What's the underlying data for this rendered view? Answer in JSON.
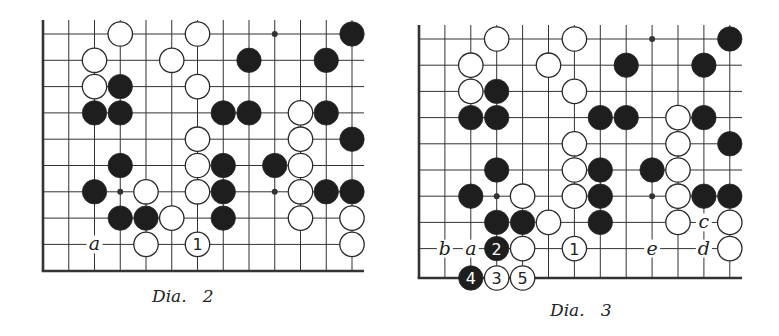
{
  "diagrams": [
    {
      "id": "dia2",
      "caption": "Dia.   2",
      "caption_pos": [
        152,
        286
      ],
      "origin": [
        43,
        34
      ],
      "spacing": [
        25.75,
        26.3
      ],
      "top_line_y": 20,
      "right_line_x": 364,
      "bottom_edge_row": 9,
      "bottom_edge_y": 271,
      "cols": 13,
      "stars": [
        [
          9,
          0
        ],
        [
          3,
          6
        ],
        [
          9,
          6
        ]
      ],
      "stones": [
        {
          "c": 3,
          "r": 0,
          "color": "white"
        },
        {
          "c": 6,
          "r": 0,
          "color": "white"
        },
        {
          "c": 12,
          "r": 0,
          "color": "black"
        },
        {
          "c": 2,
          "r": 1,
          "color": "white"
        },
        {
          "c": 5,
          "r": 1,
          "color": "white"
        },
        {
          "c": 8,
          "r": 1,
          "color": "black"
        },
        {
          "c": 11,
          "r": 1,
          "color": "black"
        },
        {
          "c": 2,
          "r": 2,
          "color": "white"
        },
        {
          "c": 3,
          "r": 2,
          "color": "black"
        },
        {
          "c": 6,
          "r": 2,
          "color": "white"
        },
        {
          "c": 2,
          "r": 3,
          "color": "black"
        },
        {
          "c": 3,
          "r": 3,
          "color": "black"
        },
        {
          "c": 7,
          "r": 3,
          "color": "black"
        },
        {
          "c": 8,
          "r": 3,
          "color": "black"
        },
        {
          "c": 10,
          "r": 3,
          "color": "white"
        },
        {
          "c": 11,
          "r": 3,
          "color": "black"
        },
        {
          "c": 6,
          "r": 4,
          "color": "white"
        },
        {
          "c": 10,
          "r": 4,
          "color": "white"
        },
        {
          "c": 12,
          "r": 4,
          "color": "black"
        },
        {
          "c": 3,
          "r": 5,
          "color": "black"
        },
        {
          "c": 6,
          "r": 5,
          "color": "white"
        },
        {
          "c": 7,
          "r": 5,
          "color": "black"
        },
        {
          "c": 9,
          "r": 5,
          "color": "black"
        },
        {
          "c": 10,
          "r": 5,
          "color": "white"
        },
        {
          "c": 2,
          "r": 6,
          "color": "black"
        },
        {
          "c": 4,
          "r": 6,
          "color": "white"
        },
        {
          "c": 6,
          "r": 6,
          "color": "white"
        },
        {
          "c": 7,
          "r": 6,
          "color": "black"
        },
        {
          "c": 10,
          "r": 6,
          "color": "white"
        },
        {
          "c": 11,
          "r": 6,
          "color": "black"
        },
        {
          "c": 12,
          "r": 6,
          "color": "black"
        },
        {
          "c": 3,
          "r": 7,
          "color": "black"
        },
        {
          "c": 4,
          "r": 7,
          "color": "black"
        },
        {
          "c": 5,
          "r": 7,
          "color": "white"
        },
        {
          "c": 7,
          "r": 7,
          "color": "black"
        },
        {
          "c": 10,
          "r": 7,
          "color": "white"
        },
        {
          "c": 12,
          "r": 7,
          "color": "white"
        },
        {
          "c": 4,
          "r": 8,
          "color": "white"
        },
        {
          "c": 6,
          "r": 8,
          "color": "white",
          "label": "1"
        },
        {
          "c": 12,
          "r": 8,
          "color": "white"
        }
      ],
      "letters": [
        {
          "c": 2,
          "r": 8,
          "text": "a"
        }
      ]
    },
    {
      "id": "dia3",
      "caption": "Dia.   3",
      "caption_pos": [
        550,
        300
      ],
      "origin": [
        419,
        39
      ],
      "spacing": [
        25.9,
        26.2
      ],
      "top_line_y": 25,
      "right_line_x": 742,
      "bottom_edge_row": 9,
      "bottom_edge_y": 278,
      "cols": 13,
      "stars": [
        [
          9,
          0
        ],
        [
          3,
          6
        ],
        [
          9,
          6
        ]
      ],
      "stones": [
        {
          "c": 3,
          "r": 0,
          "color": "white"
        },
        {
          "c": 6,
          "r": 0,
          "color": "white"
        },
        {
          "c": 12,
          "r": 0,
          "color": "black"
        },
        {
          "c": 2,
          "r": 1,
          "color": "white"
        },
        {
          "c": 5,
          "r": 1,
          "color": "white"
        },
        {
          "c": 8,
          "r": 1,
          "color": "black"
        },
        {
          "c": 11,
          "r": 1,
          "color": "black"
        },
        {
          "c": 2,
          "r": 2,
          "color": "white"
        },
        {
          "c": 3,
          "r": 2,
          "color": "black"
        },
        {
          "c": 6,
          "r": 2,
          "color": "white"
        },
        {
          "c": 2,
          "r": 3,
          "color": "black"
        },
        {
          "c": 3,
          "r": 3,
          "color": "black"
        },
        {
          "c": 7,
          "r": 3,
          "color": "black"
        },
        {
          "c": 8,
          "r": 3,
          "color": "black"
        },
        {
          "c": 10,
          "r": 3,
          "color": "white"
        },
        {
          "c": 11,
          "r": 3,
          "color": "black"
        },
        {
          "c": 6,
          "r": 4,
          "color": "white"
        },
        {
          "c": 10,
          "r": 4,
          "color": "white"
        },
        {
          "c": 12,
          "r": 4,
          "color": "black"
        },
        {
          "c": 3,
          "r": 5,
          "color": "black"
        },
        {
          "c": 6,
          "r": 5,
          "color": "white"
        },
        {
          "c": 7,
          "r": 5,
          "color": "black"
        },
        {
          "c": 9,
          "r": 5,
          "color": "black"
        },
        {
          "c": 10,
          "r": 5,
          "color": "white"
        },
        {
          "c": 2,
          "r": 6,
          "color": "black"
        },
        {
          "c": 4,
          "r": 6,
          "color": "white"
        },
        {
          "c": 6,
          "r": 6,
          "color": "white"
        },
        {
          "c": 7,
          "r": 6,
          "color": "black"
        },
        {
          "c": 10,
          "r": 6,
          "color": "white"
        },
        {
          "c": 11,
          "r": 6,
          "color": "black"
        },
        {
          "c": 12,
          "r": 6,
          "color": "black"
        },
        {
          "c": 3,
          "r": 7,
          "color": "black"
        },
        {
          "c": 4,
          "r": 7,
          "color": "black"
        },
        {
          "c": 5,
          "r": 7,
          "color": "white"
        },
        {
          "c": 7,
          "r": 7,
          "color": "black"
        },
        {
          "c": 10,
          "r": 7,
          "color": "white"
        },
        {
          "c": 12,
          "r": 7,
          "color": "white"
        },
        {
          "c": 3,
          "r": 8,
          "color": "black",
          "label": "2"
        },
        {
          "c": 4,
          "r": 8,
          "color": "white"
        },
        {
          "c": 6,
          "r": 8,
          "color": "white",
          "label": "1"
        },
        {
          "c": 12,
          "r": 8,
          "color": "white"
        },
        {
          "c": 2,
          "r": 9,
          "color": "black",
          "label": "4"
        },
        {
          "c": 3,
          "r": 9,
          "color": "white",
          "label": "3"
        },
        {
          "c": 4,
          "r": 9,
          "color": "white",
          "label": "5"
        }
      ],
      "letters": [
        {
          "c": 1,
          "r": 8,
          "text": "b"
        },
        {
          "c": 2,
          "r": 8,
          "text": "a"
        },
        {
          "c": 9,
          "r": 8,
          "text": "e"
        },
        {
          "c": 11,
          "r": 8,
          "text": "d"
        },
        {
          "c": 11,
          "r": 7,
          "text": "c"
        }
      ]
    }
  ],
  "colors": {
    "line": "#333333",
    "black_stone": "#1e1e1e",
    "white_stone": "#ffffff",
    "stone_outline": "#2a2a2a"
  }
}
